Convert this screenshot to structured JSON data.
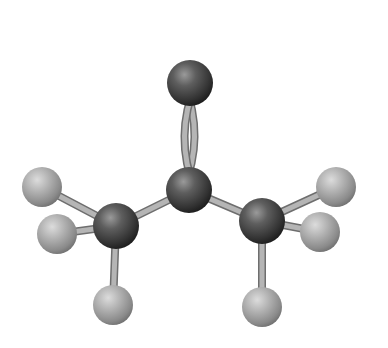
{
  "figure": {
    "colors": {
      "background": "#ffffff",
      "heavy_atom": "#4a4a4a",
      "hydrogen_atom": "#a8a8a8",
      "bond": "#b5b5b5"
    },
    "atoms": [
      {
        "id": "O",
        "type": "heavy",
        "x": 190,
        "y": 83,
        "r": 23
      },
      {
        "id": "C2",
        "type": "heavy",
        "x": 189,
        "y": 190,
        "r": 23
      },
      {
        "id": "C1",
        "type": "heavy",
        "x": 116,
        "y": 226,
        "r": 23
      },
      {
        "id": "C3",
        "type": "heavy",
        "x": 262,
        "y": 221,
        "r": 23
      },
      {
        "id": "H1a",
        "type": "hydrogen",
        "x": 42,
        "y": 187,
        "r": 20
      },
      {
        "id": "H1b",
        "type": "hydrogen",
        "x": 57,
        "y": 234,
        "r": 20
      },
      {
        "id": "H1c",
        "type": "hydrogen",
        "x": 113,
        "y": 305,
        "r": 20
      },
      {
        "id": "H3a",
        "type": "hydrogen",
        "x": 336,
        "y": 187,
        "r": 20
      },
      {
        "id": "H3b",
        "type": "hydrogen",
        "x": 320,
        "y": 232,
        "r": 20
      },
      {
        "id": "H3c",
        "type": "hydrogen",
        "x": 262,
        "y": 307,
        "r": 20
      }
    ],
    "bonds": [
      {
        "from": "C2",
        "to": "O",
        "order": 2
      },
      {
        "from": "C2",
        "to": "C1",
        "order": 1
      },
      {
        "from": "C2",
        "to": "C3",
        "order": 1
      },
      {
        "from": "C1",
        "to": "H1a",
        "order": 1
      },
      {
        "from": "C1",
        "to": "H1b",
        "order": 1
      },
      {
        "from": "C1",
        "to": "H1c",
        "order": 1
      },
      {
        "from": "C3",
        "to": "H3a",
        "order": 1
      },
      {
        "from": "C3",
        "to": "H3b",
        "order": 1
      },
      {
        "from": "C3",
        "to": "H3c",
        "order": 1
      }
    ]
  }
}
